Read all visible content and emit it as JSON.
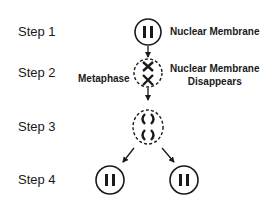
{
  "steps": [
    {
      "label": "Step 1"
    },
    {
      "label": "Step 2"
    },
    {
      "label": "Step 3"
    },
    {
      "label": "Step 4"
    }
  ],
  "annotations": {
    "step1_right": "Nuclear Membrane",
    "step2_left": "Metaphase",
    "step2_right_line1": "Nuclear Membrane",
    "step2_right_line2": "Disappears"
  },
  "colors": {
    "ink": "#1a1a1a",
    "background": "#ffffff"
  }
}
